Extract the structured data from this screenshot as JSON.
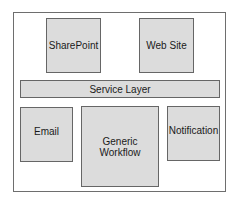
{
  "diagram": {
    "colors": {
      "box_fill": "#dcdcdc",
      "box_border": "#666666",
      "frame_border": "#6e6e6e"
    },
    "top_row": [
      {
        "label": "SharePoint"
      },
      {
        "label": "Web Site"
      }
    ],
    "service_layer": {
      "label": "Service Layer"
    },
    "bottom_row": [
      {
        "label": "Email"
      },
      {
        "label": "Generic Workflow"
      },
      {
        "label": "Notification"
      }
    ]
  }
}
